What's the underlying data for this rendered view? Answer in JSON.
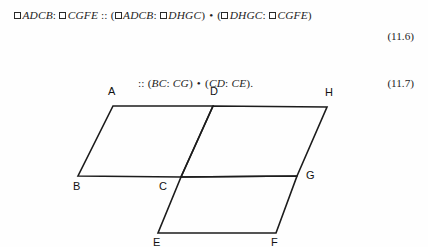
{
  "document": {
    "equations": [
      {
        "id": "11.6",
        "number": "(11.6)",
        "parts": {
          "p1": "ADCB",
          "sep1": ":",
          "p2": "CGFE",
          "prop": "::",
          "open1": "(",
          "p3": "ADCB",
          "sep2": ":",
          "p4": "DHGC",
          "close1": ")",
          "mult": "•",
          "open2": "(",
          "p5": "DHGC",
          "sep3": ":",
          "p6": "CGFE",
          "close2": ")"
        },
        "plain_text": "□ ADCB : □ CGFE :: (□ ADCB : □ DHGC) • (□ DHGC : □ CGFE)"
      },
      {
        "id": "11.7",
        "number": "(11.7)",
        "parts": {
          "prop": "::",
          "open1": "(",
          "r1": "BC",
          "sep1": ":",
          "r2": "CG",
          "close1": ")",
          "mult": "•",
          "open2": "(",
          "r3": "CD",
          "sep2": ":",
          "r4": "CE",
          "close2": ")",
          "period": "."
        },
        "plain_text": ":: (BC : CG) • (CD : CE)."
      }
    ]
  },
  "figure": {
    "caption": "three-parallelogram geometric construction",
    "stroke_color": "#1c1c1c",
    "background_color": "#fefefe",
    "vertices": [
      {
        "label": "A",
        "x": 113,
        "y": 28,
        "lx": 108,
        "ly": 8
      },
      {
        "label": "D",
        "x": 213,
        "y": 28,
        "lx": 210,
        "ly": 8
      },
      {
        "label": "H",
        "x": 327,
        "y": 29,
        "lx": 325,
        "ly": 9
      },
      {
        "label": "B",
        "x": 78,
        "y": 98,
        "lx": 73,
        "ly": 103
      },
      {
        "label": "C",
        "x": 181,
        "y": 99,
        "lx": 159,
        "ly": 103
      },
      {
        "label": "G",
        "x": 297,
        "y": 98,
        "lx": 306,
        "ly": 92
      },
      {
        "label": "E",
        "x": 158,
        "y": 155,
        "lx": 153,
        "ly": 159
      },
      {
        "label": "F",
        "x": 276,
        "y": 155,
        "lx": 271,
        "ly": 159
      }
    ],
    "polygons": [
      {
        "name": "ADCB",
        "points": "113,28 213,28 181,99 78,98"
      },
      {
        "name": "DHGC",
        "points": "213,28 327,29 297,98 181,99"
      },
      {
        "name": "CGFE",
        "points": "181,99 297,98 276,155 158,155"
      }
    ]
  }
}
